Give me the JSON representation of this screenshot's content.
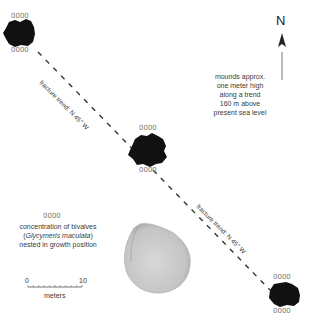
{
  "figure": {
    "north_label": "N",
    "fracture_label_1": "fracture trend: N 45° W",
    "fracture_label_2": "fracture trend: N 45° W",
    "mound_note": [
      "mounds approx.",
      "one meter high",
      "along a trend",
      "160 m above",
      "present sea level"
    ],
    "bivalve_symbol": "0000",
    "legend": {
      "line1": "concentration of bivalves",
      "line2_open": "(",
      "line2_species": "Glycymeris maculata",
      "line2_close": ")",
      "line3": "nested in growth position"
    },
    "scale": {
      "min": "0",
      "max": "10",
      "unit": "meters"
    },
    "colors": {
      "mound": "#111111",
      "shell": "#cfcfcf",
      "line": "#333333",
      "bivalve": "#777777"
    }
  }
}
